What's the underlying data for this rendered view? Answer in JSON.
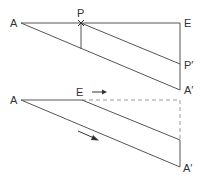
{
  "diagram": {
    "top": {
      "labels": {
        "A": "A",
        "P": "P",
        "E": "E",
        "P_prime": "P′",
        "A_prime": "A′"
      }
    },
    "bottom": {
      "labels": {
        "A": "A",
        "E": "E",
        "A_prime": "A′"
      },
      "arrows": [
        "arrow-right-near-E",
        "arrow-along-diagonal"
      ]
    },
    "colors": {
      "line": "#555555",
      "dashed": "#999999",
      "text": "#333333"
    }
  }
}
